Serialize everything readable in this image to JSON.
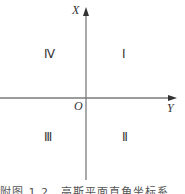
{
  "diagram": {
    "axes": {
      "vertical_label": "X",
      "horizontal_label": "Y",
      "origin_label": "O"
    },
    "quadrants": {
      "q1": "Ⅰ",
      "q2": "Ⅱ",
      "q3": "Ⅲ",
      "q4": "Ⅳ"
    },
    "caption": "附图 1.2　高斯平面直角坐标系",
    "colors": {
      "axis": "#7a7a7a",
      "text": "#333333"
    }
  }
}
